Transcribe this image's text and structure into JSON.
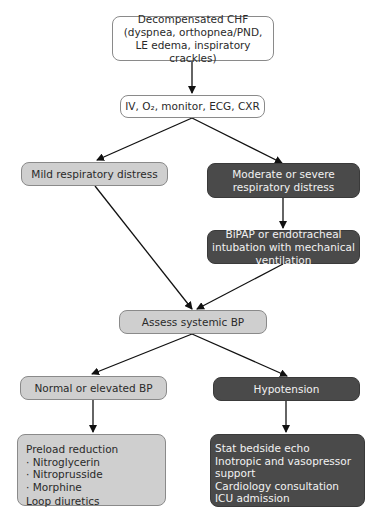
{
  "nodes": {
    "start": "Decompensated CHF (dyspnea, orthopnea/PND, LE edema, inspiratory crackles)",
    "initial": "IV, O₂, monitor, ECG, CXR",
    "mild": "Mild respiratory distress",
    "severe": "Moderate or severe respiratory distress",
    "ventilation": "BiPAP or endotracheal intubation with mechanical ventilation",
    "assess_bp": "Assess systemic BP",
    "normal_bp": "Normal or elevated BP",
    "hypotension": "Hypotension",
    "normal_tx": {
      "lines": [
        "Preload reduction",
        "· Nitroglycerin",
        "· Nitroprusside",
        "· Morphine",
        "Loop diuretics"
      ]
    },
    "hypo_tx": {
      "lines": [
        "Stat bedside echo",
        "Inotropic and vasopressor support",
        "Cardiology consultation",
        "ICU admission"
      ]
    }
  },
  "colors": {
    "light": "#cfcfcf",
    "dark": "#4a4a4a",
    "border": "#8a8a8a"
  }
}
